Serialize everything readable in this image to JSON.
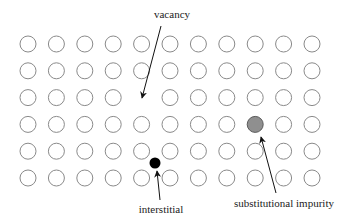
{
  "diagram": {
    "lattice": {
      "rows": 6,
      "cols": 11,
      "x0": 28,
      "y0": 44,
      "dx": 28.4,
      "dy": 26.8,
      "radius": 8,
      "stroke_color": "#8a8a8a",
      "fill_color": "#ffffff"
    },
    "defects": {
      "vacancy": {
        "row": 2,
        "col": 4,
        "label": "vacancy"
      },
      "substitutional": {
        "row": 3,
        "col": 8,
        "label": "substitutional impurity",
        "fill_color": "#8f8f8f",
        "stroke_color": "#5a5a5a"
      },
      "interstitial": {
        "x": 155,
        "y": 163,
        "radius": 5.5,
        "label": "interstitial",
        "fill_color": "#000000"
      }
    },
    "labels": {
      "vacancy": "vacancy",
      "interstitial": "interstitial",
      "substitutional": "substitutional impurity"
    },
    "arrows": [
      {
        "name": "vacancy-arrow",
        "x1": 161,
        "y1": 26,
        "x2": 142,
        "y2": 98
      },
      {
        "name": "interstitial-arrow",
        "x1": 160,
        "y1": 200,
        "x2": 157,
        "y2": 171
      },
      {
        "name": "substitutional-arrow",
        "x1": 276,
        "y1": 193,
        "x2": 261,
        "y2": 137
      }
    ]
  }
}
